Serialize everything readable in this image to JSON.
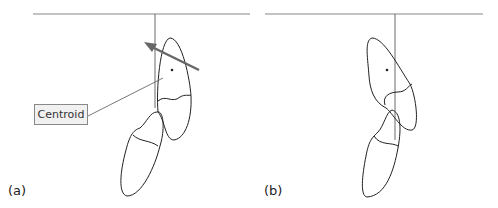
{
  "panels": [
    {
      "label": "(a)",
      "annotation": "Centroid"
    },
    {
      "label": "(b)"
    }
  ],
  "colors": {
    "line": "#222222",
    "ground": "#888888",
    "arrow": "#666666",
    "label_box": "#f1f1f1"
  }
}
